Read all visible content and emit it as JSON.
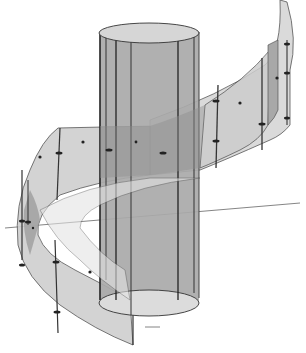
{
  "figure": {
    "colors": {
      "background": "#ffffff",
      "cylinder_fill": "#a8a8a8",
      "cylinder_top": "#d4d4d4",
      "cylinder_bottom": "#dcdcdc",
      "ribbon_fill": "#cfcfcf",
      "ribbon_dark": "#9a9a9a",
      "edge": "#333333",
      "axis": "#555555"
    },
    "text_labels": []
  }
}
